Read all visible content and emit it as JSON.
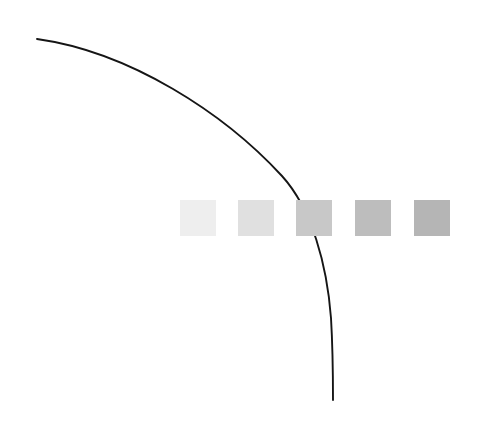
{
  "canvas": {
    "width": 479,
    "height": 424,
    "background_color": "#ffffff",
    "description": "abstract-figure"
  },
  "chart_data": {
    "type": "scatter",
    "title": "",
    "subtitle": "",
    "xlabel": "",
    "ylabel": "",
    "grid": false,
    "legend": "none",
    "xlim": [
      0,
      479
    ],
    "ylim": [
      0,
      424
    ],
    "annotations": [],
    "tick_labels": {
      "x": [],
      "y": []
    },
    "series": [
      {
        "name": "gradient-square-row",
        "type": "marker-row",
        "marker": "square",
        "marker_size": 36,
        "y": 218,
        "values": [
          {
            "index": 1,
            "x": 198,
            "y": 218,
            "color": "#eeeeee"
          },
          {
            "index": 2,
            "x": 256,
            "y": 218,
            "color": "#e0e0e0"
          },
          {
            "index": 3,
            "x": 314,
            "y": 218,
            "color": "#c8c8c8"
          },
          {
            "index": 4,
            "x": 373,
            "y": 218,
            "color": "#bdbdbd"
          },
          {
            "index": 5,
            "x": 432,
            "y": 218,
            "color": "#b5b5b5"
          }
        ]
      },
      {
        "name": "descending-arc",
        "type": "curve",
        "color": "#151515",
        "stroke_width": 1.9,
        "path": "M 37 39 C 130 52 224 113 282 176 C 312 209 327 265 331 318 C 333 352 333 380 333 400",
        "start_point": [
          37,
          39
        ],
        "end_point": [
          333,
          400
        ],
        "control_points": [
          [
            130,
            52
          ],
          [
            224,
            113
          ],
          [
            282,
            176
          ],
          [
            312,
            209
          ],
          [
            327,
            265
          ],
          [
            331,
            318
          ],
          [
            333,
            352
          ],
          [
            333,
            380
          ]
        ]
      }
    ],
    "z_order": [
      "descending-arc",
      "gradient-square-row"
    ]
  }
}
